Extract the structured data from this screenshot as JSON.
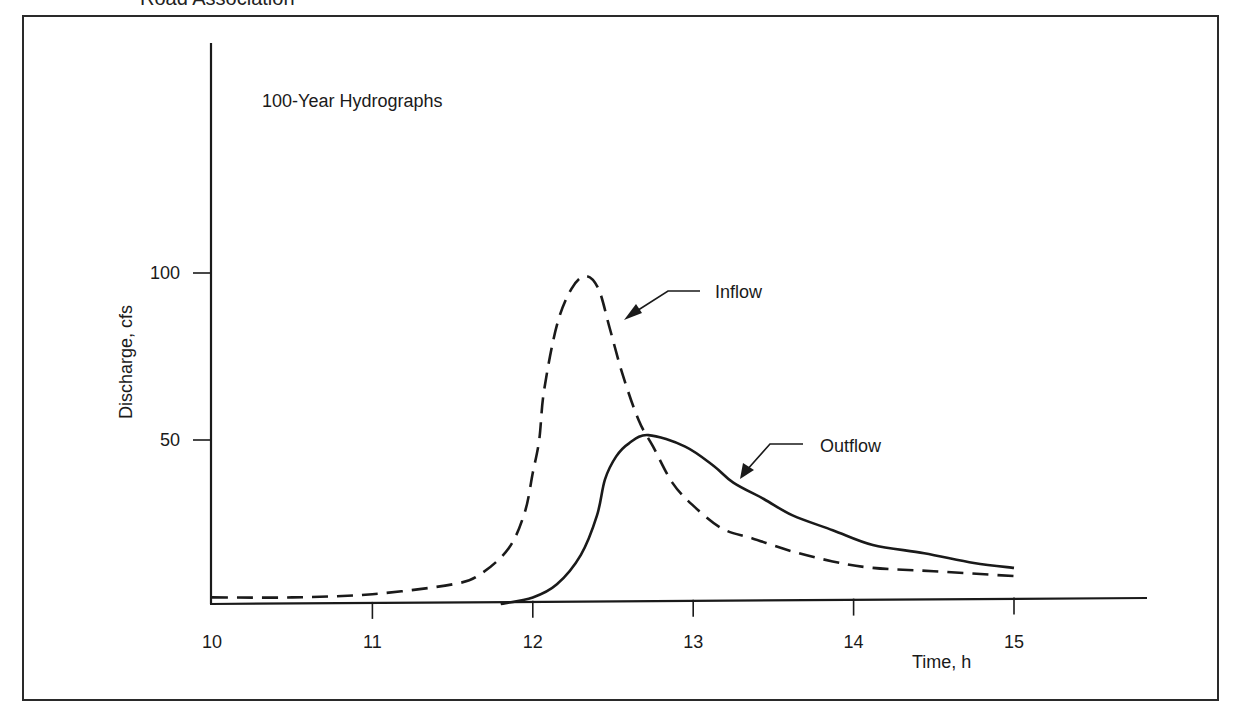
{
  "page": {
    "clipped_header_text": "Road Association",
    "clipped_footer_text": ""
  },
  "chart_data": {
    "type": "line",
    "title": "100-Year Hydrographs",
    "xlabel": "Time, h",
    "ylabel": "Discharge, cfs",
    "xlim": [
      10,
      15.8
    ],
    "ylim": [
      0,
      130
    ],
    "x_ticks": [
      10,
      11,
      12,
      13,
      14,
      15
    ],
    "x_tick_labels": [
      "10",
      "11",
      "12",
      "13",
      "14",
      "15"
    ],
    "y_ticks": [
      50,
      100
    ],
    "y_tick_labels": [
      "50",
      "100"
    ],
    "grid": false,
    "legend": "none (inline arrow annotations)",
    "series": [
      {
        "name": "Inflow",
        "style": "dashed",
        "color": "#1a1a1a",
        "x": [
          10.0,
          10.5,
          11.0,
          11.5,
          11.67,
          11.85,
          11.95,
          12.0,
          12.04,
          12.07,
          12.15,
          12.24,
          12.33,
          12.41,
          12.48,
          12.56,
          12.66,
          12.75,
          12.87,
          13.0,
          13.18,
          13.37,
          13.62,
          13.87,
          14.12,
          14.5,
          15.0
        ],
        "values": [
          2,
          2,
          3,
          6,
          9,
          17,
          28,
          40,
          50,
          65,
          85,
          96,
          100,
          96,
          84,
          70,
          56,
          48,
          37,
          30,
          23,
          20,
          16,
          13,
          11,
          10,
          8.5
        ]
      },
      {
        "name": "Outflow",
        "style": "solid",
        "color": "#1a1a1a",
        "x": [
          11.8,
          12.0,
          12.15,
          12.3,
          12.4,
          12.45,
          12.52,
          12.6,
          12.72,
          12.95,
          13.13,
          13.25,
          13.44,
          13.62,
          13.87,
          14.12,
          14.44,
          14.75,
          15.0
        ],
        "values": [
          0,
          2,
          6,
          15,
          27,
          38,
          45,
          49,
          51.5,
          48,
          42,
          37,
          32,
          27,
          22.5,
          18,
          15.5,
          12.5,
          11
        ]
      }
    ],
    "annotations": [
      {
        "text": "Inflow",
        "points_to_series": "Inflow",
        "near_x": 12.55,
        "near_y": 87
      },
      {
        "text": "Outflow",
        "points_to_series": "Outflow",
        "near_x": 13.3,
        "near_y": 38
      }
    ],
    "peaks": {
      "inflow": {
        "time_h": 12.33,
        "discharge_cfs": 100
      },
      "outflow": {
        "time_h": 12.72,
        "discharge_cfs": 51.5
      }
    }
  }
}
